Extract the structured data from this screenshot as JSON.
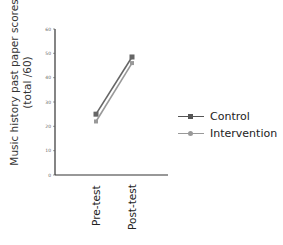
{
  "chart_data": {
    "type": "line",
    "title": "",
    "xlabel": "",
    "ylabel": "Music history past paper scores (total /60)",
    "ylabel_lines": [
      "Music history past paper scores",
      "(total /60)"
    ],
    "categories": [
      "Pre-test",
      "Post-test"
    ],
    "series": [
      {
        "name": "Control",
        "values": [
          25,
          48.5
        ],
        "color": "#666666",
        "marker": "square"
      },
      {
        "name": "Intervention",
        "values": [
          22,
          46
        ],
        "color": "#999999",
        "marker": "circle"
      }
    ],
    "ylim": [
      0,
      60
    ],
    "yticks": [
      0,
      10,
      20,
      30,
      40,
      50,
      60
    ],
    "grid": false,
    "legend_position": "right"
  },
  "legend": {
    "items": [
      {
        "label": "Control"
      },
      {
        "label": "Intervention"
      }
    ]
  }
}
